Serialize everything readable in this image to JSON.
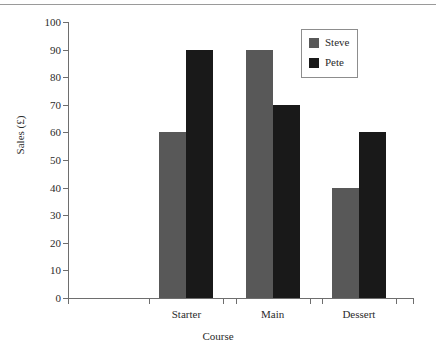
{
  "chart_data": {
    "type": "bar",
    "title": "",
    "xlabel": "Course",
    "ylabel": "Sales (£)",
    "categories": [
      "Starter",
      "Main",
      "Dessert"
    ],
    "series": [
      {
        "name": "Steve",
        "color": "#585858",
        "values": [
          60,
          90,
          40
        ]
      },
      {
        "name": "Pete",
        "color": "#191919",
        "values": [
          90,
          70,
          60
        ]
      }
    ],
    "ylim": [
      0,
      100
    ],
    "yticks": [
      0,
      10,
      20,
      30,
      40,
      50,
      60,
      70,
      80,
      90,
      100
    ],
    "ytick_labels": [
      "0",
      "10",
      "20",
      "30",
      "40",
      "50",
      "60",
      "70",
      "80",
      "90",
      "100"
    ],
    "grid": false,
    "legend_position": "top-right",
    "legend_entries": [
      "Steve",
      "Pete"
    ]
  }
}
